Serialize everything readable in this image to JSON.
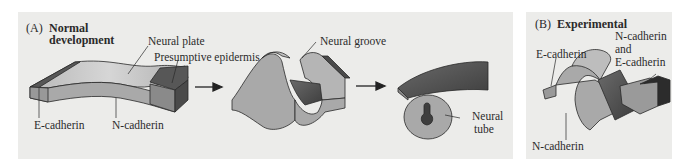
{
  "panels": {
    "a": {
      "letter": "(A)",
      "title_line1": "Normal",
      "title_line2": "development",
      "labels": {
        "neural_plate": "Neural plate",
        "presumptive_epidermis": "Presumptive epidermis",
        "e_cadherin": "E-cadherin",
        "n_cadherin": "N-cadherin",
        "neural_groove": "Neural groove",
        "neural_tube_line1": "Neural",
        "neural_tube_line2": "tube"
      },
      "stages": [
        "neural plate",
        "neural groove",
        "neural tube"
      ]
    },
    "b": {
      "letter": "(B)",
      "title": "Experimental",
      "labels": {
        "e_cadherin": "E-cadherin",
        "n_and_e_line1": "N-cadherin",
        "n_and_e_line2": "and",
        "n_and_e_line3": "E-cadherin",
        "n_cadherin": "N-cadherin"
      }
    }
  },
  "colors": {
    "panel_bg": "#ececea",
    "n_cadherin_tissue": "#a9a9a9",
    "e_cadherin_tissue": "#575757",
    "top_surface": "#c8c8c8",
    "outline": "#2a2a2a"
  }
}
